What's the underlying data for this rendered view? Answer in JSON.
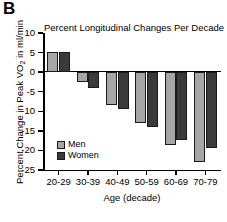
{
  "panel": {
    "letter": "B"
  },
  "chart_data": {
    "type": "bar",
    "title": "Percent Longitudinal Changes Per Decade",
    "xlabel": "Age (decade)",
    "ylabel": "Percent Change in Peak VO2 in ml/min",
    "ylabel_main": "Percent Change in Peak VO",
    "ylabel_sub": "2",
    "ylabel_tail": " in ml/min",
    "categories": [
      "20-29",
      "30-39",
      "40-49",
      "50-59",
      "60-69",
      "70-79"
    ],
    "series": [
      {
        "name": "Men",
        "color": "#a6a6a6",
        "values": [
          5.1,
          -2.5,
          -8.5,
          -13.0,
          -18.5,
          -23.0
        ]
      },
      {
        "name": "Women",
        "color": "#3a3a3a",
        "values": [
          5.2,
          -4.1,
          -9.3,
          -14.0,
          -17.3,
          -19.5
        ]
      }
    ],
    "ylim": [
      -25,
      10
    ],
    "yticks": [
      10,
      5,
      0,
      -5,
      -10,
      -15,
      -20,
      -25
    ],
    "ytick_labels": [
      "10",
      "5",
      "0",
      "-5",
      "-10",
      "-15",
      "-20",
      "-25"
    ],
    "grid": false,
    "legend_position": "inside-lower-left",
    "zero_line": true
  },
  "legend": {
    "items": [
      {
        "label": "Men"
      },
      {
        "label": "Women"
      }
    ]
  }
}
